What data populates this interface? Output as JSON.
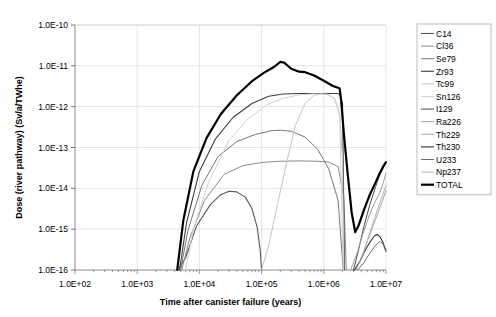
{
  "chart_data": {
    "type": "line",
    "title": "",
    "xlabel": "Time after canister failure (years)",
    "ylabel": "Dose (river pathway) (Sv/a/TWhe)",
    "xscale": "log",
    "yscale": "log",
    "xlim": [
      100,
      10000000
    ],
    "ylim": [
      1e-16,
      1e-10
    ],
    "xticks": [
      "1.0E+02",
      "1.0E+03",
      "1.0E+04",
      "1.0E+05",
      "1.0E+06",
      "1.0E+07"
    ],
    "xtick_values": [
      100,
      1000,
      10000,
      100000,
      1000000,
      10000000
    ],
    "yticks": [
      "1.0E-16",
      "1.0E-15",
      "1.0E-14",
      "1.0E-13",
      "1.0E-12",
      "1.0E-11",
      "1.0E-10"
    ],
    "ytick_values": [
      1e-16,
      1e-15,
      1e-14,
      1e-13,
      1e-12,
      1e-11,
      1e-10
    ],
    "grid": true,
    "legend_position": "right",
    "series": [
      {
        "name": "C14",
        "color": "#555555",
        "width": 1.1,
        "points": [
          [
            4500,
            1e-16
          ],
          [
            6000,
            2e-16
          ],
          [
            9000,
            1.2e-15
          ],
          [
            15000,
            4e-15
          ],
          [
            22000,
            7e-15
          ],
          [
            30000,
            8.5e-15
          ],
          [
            40000,
            8.2e-15
          ],
          [
            55000,
            6e-15
          ],
          [
            70000,
            3.2e-15
          ],
          [
            85000,
            1.1e-15
          ],
          [
            95000,
            3e-16
          ],
          [
            100000,
            1e-16
          ]
        ]
      },
      {
        "name": "Cl36",
        "color": "#8a8a8a",
        "width": 1.0,
        "points": [
          [
            5200,
            1e-16
          ],
          [
            7000,
            6e-16
          ],
          [
            12000,
            5e-15
          ],
          [
            25000,
            2.2e-14
          ],
          [
            50000,
            3.6e-14
          ],
          [
            100000,
            4.3e-14
          ],
          [
            200000,
            4.6e-14
          ],
          [
            400000,
            4.7e-14
          ],
          [
            800000,
            4.6e-14
          ],
          [
            1200000,
            4.4e-14
          ],
          [
            1700000,
            3.4e-14
          ],
          [
            2100000,
            6e-15
          ],
          [
            2300000,
            1e-16
          ]
        ]
      },
      {
        "name": "Se79",
        "color": "#777777",
        "width": 1.0,
        "points": [
          [
            5000,
            1e-16
          ],
          [
            6500,
            9e-16
          ],
          [
            11000,
            1.2e-14
          ],
          [
            20000,
            6e-14
          ],
          [
            40000,
            1.4e-13
          ],
          [
            80000,
            2.1e-13
          ],
          [
            150000,
            2.6e-13
          ],
          [
            200000,
            2.65e-13
          ],
          [
            300000,
            2.5e-13
          ],
          [
            500000,
            1.8e-13
          ],
          [
            800000,
            9e-14
          ],
          [
            1200000,
            3e-14
          ],
          [
            1700000,
            5e-15
          ],
          [
            2050000,
            1e-16
          ]
        ]
      },
      {
        "name": "Zr93",
        "color": "#3f3f3f",
        "width": 1.1,
        "points": [
          [
            4800,
            1e-16
          ],
          [
            6200,
            1.4e-15
          ],
          [
            10000,
            2.6e-14
          ],
          [
            18000,
            1.6e-13
          ],
          [
            35000,
            5.5e-13
          ],
          [
            70000,
            1.2e-12
          ],
          [
            130000,
            1.8e-12
          ],
          [
            220000,
            2.05e-12
          ],
          [
            400000,
            2.1e-12
          ],
          [
            700000,
            2.1e-12
          ],
          [
            1100000,
            2.1e-12
          ],
          [
            1600000,
            2.1e-12
          ],
          [
            1800000,
            2.05e-12
          ],
          [
            2000000,
            1.2e-12
          ],
          [
            2150000,
            1e-16
          ]
        ]
      },
      {
        "name": "Tc99",
        "color": "#c6c6c6",
        "width": 1.0,
        "points": [
          [
            100000,
            1e-16
          ],
          [
            130000,
            4e-16
          ],
          [
            180000,
            4e-15
          ],
          [
            250000,
            4e-14
          ],
          [
            350000,
            3.5e-13
          ],
          [
            500000,
            1.2e-12
          ],
          [
            700000,
            1.9e-12
          ],
          [
            900000,
            2.05e-12
          ],
          [
            1200000,
            2e-12
          ],
          [
            1500000,
            1.5e-12
          ],
          [
            1800000,
            6e-13
          ],
          [
            2000000,
            5e-14
          ],
          [
            2100000,
            1e-16
          ]
        ]
      },
      {
        "name": "Sn126",
        "color": "#d2d2d2",
        "width": 1.0,
        "points": [
          [
            6000,
            1e-16
          ],
          [
            8000,
            1e-15
          ],
          [
            14000,
            1.4e-14
          ],
          [
            30000,
            1.5e-13
          ],
          [
            60000,
            5e-13
          ],
          [
            120000,
            1.1e-12
          ],
          [
            220000,
            1.6e-12
          ],
          [
            400000,
            1.95e-12
          ],
          [
            700000,
            2.05e-12
          ],
          [
            1100000,
            2e-12
          ],
          [
            1500000,
            1.6e-12
          ],
          [
            1800000,
            7e-13
          ],
          [
            2050000,
            1e-16
          ]
        ]
      },
      {
        "name": "I129",
        "color": "#4a4a4a",
        "width": 1.0,
        "points": [
          [
            3000000,
            1e-16
          ],
          [
            3600000,
            3e-16
          ],
          [
            4500000,
            1.3e-15
          ],
          [
            5500000,
            4e-15
          ],
          [
            6800000,
            1.1e-14
          ],
          [
            8000000,
            2.2e-14
          ],
          [
            9200000,
            3.4e-14
          ],
          [
            10000000,
            4.3e-14
          ]
        ]
      },
      {
        "name": "Ra226",
        "color": "#9e9e9e",
        "width": 1.0,
        "points": [
          [
            2700000,
            1e-16
          ],
          [
            3400000,
            2.5e-16
          ],
          [
            4300000,
            8e-16
          ],
          [
            5400000,
            2.2e-15
          ],
          [
            6600000,
            4.5e-15
          ],
          [
            8000000,
            8e-15
          ],
          [
            9200000,
            1.5e-14
          ],
          [
            10000000,
            2.4e-14
          ]
        ]
      },
      {
        "name": "Th229",
        "color": "#a8a8a8",
        "width": 1.0,
        "points": [
          [
            3200000,
            1e-16
          ],
          [
            4000000,
            2e-16
          ],
          [
            5000000,
            5e-16
          ],
          [
            6200000,
            1.2e-15
          ],
          [
            7500000,
            2.6e-15
          ],
          [
            8800000,
            5e-15
          ],
          [
            10000000,
            9e-15
          ]
        ]
      },
      {
        "name": "Th230",
        "color": "#2e2e2e",
        "width": 1.1,
        "points": [
          [
            3100000,
            1e-16
          ],
          [
            3800000,
            1.6e-16
          ],
          [
            4600000,
            3e-16
          ],
          [
            5600000,
            5e-16
          ],
          [
            6500000,
            6.8e-16
          ],
          [
            7200000,
            7.4e-16
          ],
          [
            8000000,
            6.5e-16
          ],
          [
            8800000,
            5e-16
          ],
          [
            9500000,
            3.6e-16
          ],
          [
            10000000,
            3e-16
          ]
        ]
      },
      {
        "name": "U233",
        "color": "#6e6e6e",
        "width": 1.0,
        "points": [
          [
            3500000,
            1e-16
          ],
          [
            4400000,
            1.5e-16
          ],
          [
            5500000,
            2.6e-16
          ],
          [
            6800000,
            4e-16
          ],
          [
            8000000,
            5e-16
          ],
          [
            9000000,
            4.3e-16
          ],
          [
            10000000,
            2.8e-16
          ]
        ]
      },
      {
        "name": "Np237",
        "color": "#b5b5b5",
        "width": 1.0,
        "points": [
          [
            3300000,
            1e-16
          ],
          [
            4200000,
            2.2e-16
          ],
          [
            5300000,
            7e-16
          ],
          [
            6500000,
            1.8e-15
          ],
          [
            7800000,
            4e-15
          ],
          [
            9000000,
            7.5e-15
          ],
          [
            10000000,
            1.2e-14
          ]
        ]
      },
      {
        "name": "TOTAL",
        "color": "#000000",
        "width": 2.2,
        "points": [
          [
            4400,
            1e-16
          ],
          [
            5500,
            1.6e-15
          ],
          [
            8000,
            2.6e-14
          ],
          [
            13000,
            1.7e-13
          ],
          [
            22000,
            6.5e-13
          ],
          [
            40000,
            1.9e-12
          ],
          [
            70000,
            4.2e-12
          ],
          [
            110000,
            6.8e-12
          ],
          [
            160000,
            9.5e-12
          ],
          [
            200000,
            1.25e-11
          ],
          [
            230000,
            1.2e-11
          ],
          [
            300000,
            8.5e-12
          ],
          [
            400000,
            7.2e-12
          ],
          [
            500000,
            7e-12
          ],
          [
            700000,
            5.8e-12
          ],
          [
            1000000,
            4.3e-12
          ],
          [
            1400000,
            3.2e-12
          ],
          [
            1700000,
            2.9e-12
          ],
          [
            1800000,
            2.8e-12
          ],
          [
            1900000,
            1.4e-12
          ],
          [
            2100000,
            2.2e-13
          ],
          [
            2400000,
            2.6e-14
          ],
          [
            2800000,
            2.6e-15
          ],
          [
            3200000,
            8.5e-16
          ],
          [
            3600000,
            1.2e-15
          ],
          [
            4500000,
            3.2e-15
          ],
          [
            5500000,
            7e-15
          ],
          [
            6800000,
            1.4e-14
          ],
          [
            8000000,
            2.4e-14
          ],
          [
            9200000,
            3.6e-14
          ],
          [
            10000000,
            4.4e-14
          ]
        ]
      }
    ]
  },
  "legend": {
    "entries": [
      {
        "label": "C14"
      },
      {
        "label": "Cl36"
      },
      {
        "label": "Se79"
      },
      {
        "label": "Zr93"
      },
      {
        "label": "Tc99"
      },
      {
        "label": "Sn126"
      },
      {
        "label": "I129"
      },
      {
        "label": "Ra226"
      },
      {
        "label": "Th229"
      },
      {
        "label": "Th230"
      },
      {
        "label": "U233"
      },
      {
        "label": "Np237"
      },
      {
        "label": "TOTAL"
      }
    ]
  },
  "style": {
    "plot_border_color": "#999999",
    "grid_color": "#d9d9d9",
    "background": "#ffffff",
    "legend_border_color": "#aaaaaa"
  }
}
